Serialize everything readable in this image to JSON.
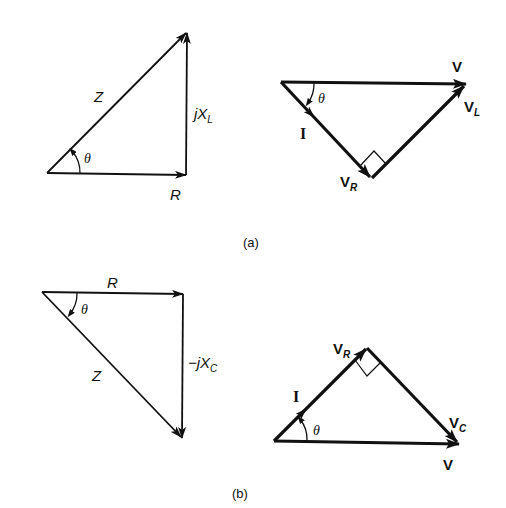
{
  "figure": {
    "panel_a": {
      "caption": "(a)",
      "impedance_triangle": {
        "hypotenuse_label": "Z",
        "horizontal_label": "R",
        "vertical_label_prefix": "j",
        "vertical_label_main": "X",
        "vertical_label_sub": "L",
        "angle_label": "θ"
      },
      "phasor_triangle": {
        "resultant_label": "V",
        "current_label": "I",
        "resistor_voltage_main": "V",
        "resistor_voltage_sub": "R",
        "inductor_voltage_main": "V",
        "inductor_voltage_sub": "L",
        "angle_label": "θ"
      }
    },
    "panel_b": {
      "caption": "(b)",
      "impedance_triangle": {
        "hypotenuse_label": "Z",
        "horizontal_label": "R",
        "vertical_label_prefix": "−j",
        "vertical_label_main": "X",
        "vertical_label_sub": "C",
        "angle_label": "θ"
      },
      "phasor_triangle": {
        "resultant_label": "V",
        "current_label": "I",
        "resistor_voltage_main": "V",
        "resistor_voltage_sub": "R",
        "capacitor_voltage_main": "V",
        "capacitor_voltage_sub": "C",
        "angle_label": "θ"
      }
    },
    "colors": {
      "stroke": "#111111",
      "background": "#ffffff"
    }
  }
}
